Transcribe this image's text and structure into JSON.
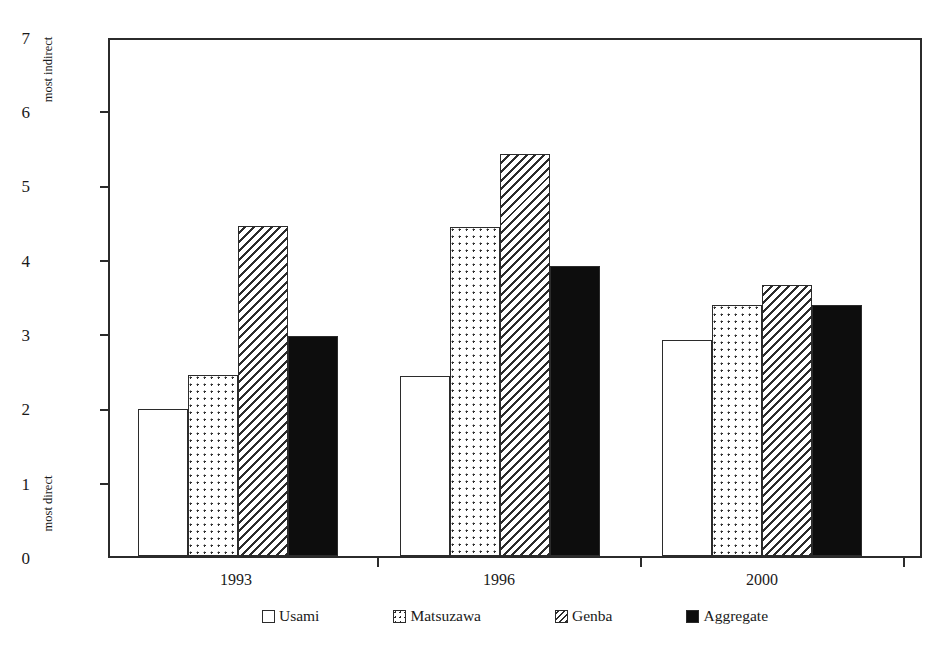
{
  "chart_data": {
    "type": "bar",
    "title": "",
    "xlabel": "",
    "ylabel": "Voter Mobilization Strategy",
    "categories": [
      "1993",
      "1996",
      "2000"
    ],
    "series": [
      {
        "name": "Usami",
        "pattern": "empty",
        "values": [
          2.0,
          2.44,
          2.93
        ]
      },
      {
        "name": "Matsuzawa",
        "pattern": "dots",
        "values": [
          2.46,
          4.47,
          3.41
        ]
      },
      {
        "name": "Genba",
        "pattern": "hatch",
        "values": [
          4.48,
          5.46,
          3.67
        ]
      },
      {
        "name": "Aggregate",
        "pattern": "solid",
        "values": [
          2.98,
          3.94,
          3.41
        ]
      }
    ],
    "ylim": [
      0,
      7
    ],
    "y_ticks": [
      "0",
      "1",
      "2",
      "3",
      "4",
      "5",
      "6",
      "7"
    ],
    "y_axis_anchor_high": "most indirect",
    "y_axis_anchor_low": "most direct",
    "grid": false,
    "legend_position": "bottom",
    "colors": {
      "axis": "#2b2b2b",
      "solid_fill": "#0d0d0d",
      "empty_fill": "#ffffff",
      "background": "#ffffff"
    }
  }
}
